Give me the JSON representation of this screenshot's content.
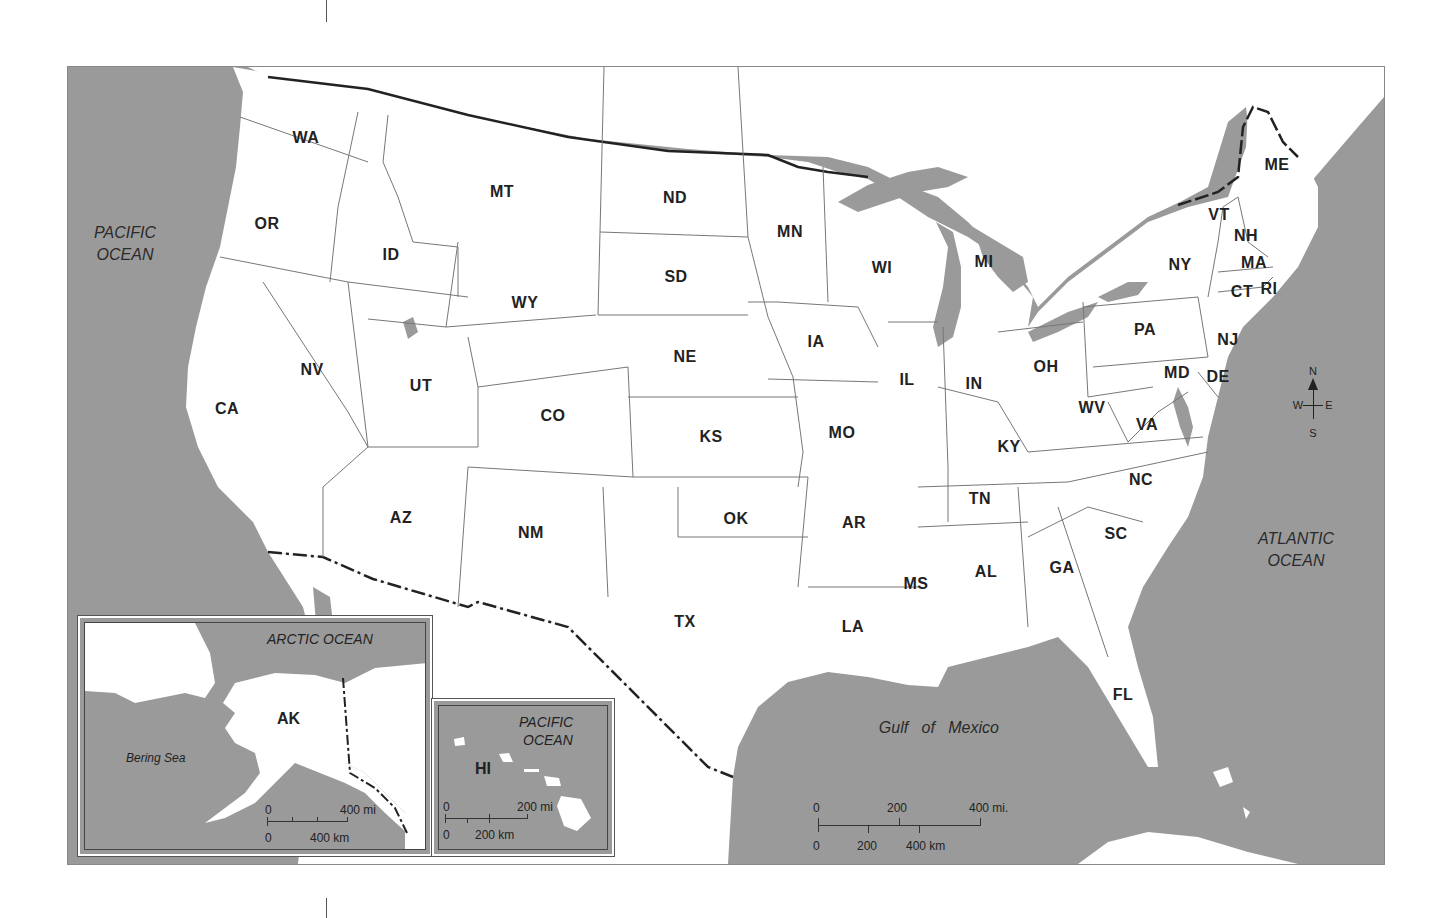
{
  "map": {
    "title": "United States Map",
    "colors": {
      "water": "#9a9a9a",
      "land": "#ffffff",
      "border": "#777777",
      "international_border": "#222222"
    },
    "states": [
      {
        "abbr": "WA",
        "x": 238,
        "y": 71
      },
      {
        "abbr": "OR",
        "x": 199,
        "y": 157
      },
      {
        "abbr": "ID",
        "x": 323,
        "y": 188
      },
      {
        "abbr": "MT",
        "x": 434,
        "y": 125
      },
      {
        "abbr": "ND",
        "x": 607,
        "y": 131
      },
      {
        "abbr": "SD",
        "x": 608,
        "y": 210
      },
      {
        "abbr": "WY",
        "x": 457,
        "y": 236
      },
      {
        "abbr": "MN",
        "x": 722,
        "y": 165
      },
      {
        "abbr": "WI",
        "x": 814,
        "y": 201
      },
      {
        "abbr": "MI",
        "x": 916,
        "y": 195
      },
      {
        "abbr": "NY",
        "x": 1112,
        "y": 198
      },
      {
        "abbr": "VT",
        "x": 1151,
        "y": 148
      },
      {
        "abbr": "NH",
        "x": 1178,
        "y": 169
      },
      {
        "abbr": "ME",
        "x": 1209,
        "y": 98
      },
      {
        "abbr": "MA",
        "x": 1186,
        "y": 196
      },
      {
        "abbr": "CT",
        "x": 1174,
        "y": 225
      },
      {
        "abbr": "RI",
        "x": 1201,
        "y": 222
      },
      {
        "abbr": "NJ",
        "x": 1160,
        "y": 273
      },
      {
        "abbr": "PA",
        "x": 1077,
        "y": 263
      },
      {
        "abbr": "DE",
        "x": 1150,
        "y": 310
      },
      {
        "abbr": "MD",
        "x": 1109,
        "y": 306
      },
      {
        "abbr": "NV",
        "x": 244,
        "y": 303
      },
      {
        "abbr": "UT",
        "x": 353,
        "y": 319
      },
      {
        "abbr": "CO",
        "x": 485,
        "y": 349
      },
      {
        "abbr": "NE",
        "x": 617,
        "y": 290
      },
      {
        "abbr": "IA",
        "x": 748,
        "y": 275
      },
      {
        "abbr": "IL",
        "x": 839,
        "y": 313
      },
      {
        "abbr": "IN",
        "x": 906,
        "y": 317
      },
      {
        "abbr": "OH",
        "x": 978,
        "y": 300
      },
      {
        "abbr": "WV",
        "x": 1024,
        "y": 341
      },
      {
        "abbr": "VA",
        "x": 1079,
        "y": 358
      },
      {
        "abbr": "CA",
        "x": 159,
        "y": 342
      },
      {
        "abbr": "KS",
        "x": 643,
        "y": 370
      },
      {
        "abbr": "MO",
        "x": 774,
        "y": 366
      },
      {
        "abbr": "KY",
        "x": 941,
        "y": 380
      },
      {
        "abbr": "NC",
        "x": 1073,
        "y": 413
      },
      {
        "abbr": "TN",
        "x": 912,
        "y": 432
      },
      {
        "abbr": "AZ",
        "x": 333,
        "y": 451
      },
      {
        "abbr": "NM",
        "x": 463,
        "y": 466
      },
      {
        "abbr": "OK",
        "x": 668,
        "y": 452
      },
      {
        "abbr": "AR",
        "x": 786,
        "y": 456
      },
      {
        "abbr": "SC",
        "x": 1048,
        "y": 467
      },
      {
        "abbr": "MS",
        "x": 848,
        "y": 517
      },
      {
        "abbr": "AL",
        "x": 918,
        "y": 505
      },
      {
        "abbr": "GA",
        "x": 994,
        "y": 501
      },
      {
        "abbr": "TX",
        "x": 617,
        "y": 555
      },
      {
        "abbr": "LA",
        "x": 785,
        "y": 560
      },
      {
        "abbr": "FL",
        "x": 1055,
        "y": 628
      }
    ],
    "water_bodies": [
      {
        "name": "PACIFIC",
        "line2": "OCEAN",
        "x": 57,
        "y": 177
      },
      {
        "name": "ATLANTIC",
        "line2": "OCEAN",
        "x": 1228,
        "y": 483
      },
      {
        "name": "Gulf   of   Mexico",
        "line2": "",
        "x": 862,
        "y": 661
      }
    ],
    "compass": {
      "n": "N",
      "s": "S",
      "e": "E",
      "w": "W"
    },
    "scale_bar": {
      "miles": [
        "0",
        "200",
        "400 mi."
      ],
      "km": [
        "0",
        "200",
        "400 km"
      ]
    },
    "alaska_inset": {
      "label": "AK",
      "ocean_label": "ARCTIC OCEAN",
      "sea_label": "Bering Sea",
      "scale_miles": [
        "0",
        "400 mi"
      ],
      "scale_km": [
        "0",
        "400 km"
      ]
    },
    "hawaii_inset": {
      "label": "HI",
      "ocean_line1": "PACIFIC",
      "ocean_line2": "OCEAN",
      "scale_miles": [
        "0",
        "200 mi"
      ],
      "scale_km": [
        "0",
        "200 km"
      ]
    }
  }
}
